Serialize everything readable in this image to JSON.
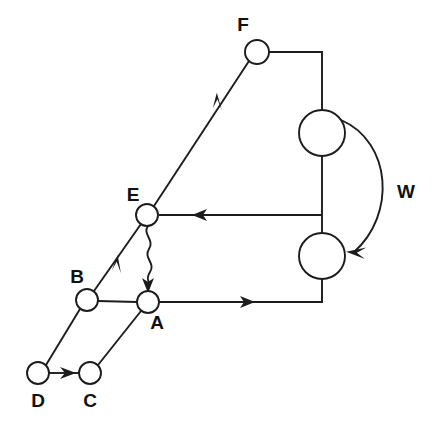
{
  "diagram": {
    "background_color": "#ffffff",
    "stroke_color": "#1c1c1c",
    "label_color": "#111111",
    "nodes": [
      {
        "id": "F",
        "label": "F",
        "cx": 257,
        "cy": 52,
        "r": 12,
        "label_x": 243,
        "label_y": 26,
        "size": "small"
      },
      {
        "id": "E",
        "label": "E",
        "cx": 147,
        "cy": 215,
        "r": 11,
        "label_x": 133,
        "label_y": 196,
        "size": "small"
      },
      {
        "id": "B",
        "label": "B",
        "cx": 87,
        "cy": 300,
        "r": 11,
        "label_x": 77,
        "label_y": 278,
        "size": "small"
      },
      {
        "id": "A",
        "label": "A",
        "cx": 148,
        "cy": 302,
        "r": 11,
        "label_x": 157,
        "label_y": 324,
        "size": "small"
      },
      {
        "id": "C",
        "label": "C",
        "cx": 90,
        "cy": 373,
        "r": 11,
        "label_x": 90,
        "label_y": 402,
        "size": "small"
      },
      {
        "id": "D",
        "label": "D",
        "cx": 38,
        "cy": 373,
        "r": 11,
        "label_x": 38,
        "label_y": 402,
        "size": "small"
      },
      {
        "id": "U1",
        "label": "",
        "cx": 322,
        "cy": 133,
        "r": 23,
        "label_x": null,
        "label_y": null,
        "size": "large"
      },
      {
        "id": "U2",
        "label": "",
        "cx": 322,
        "cy": 256,
        "r": 23,
        "label_x": null,
        "label_y": null,
        "size": "large"
      }
    ],
    "edges": [
      {
        "id": "E-to-F",
        "from": "E",
        "to": "F",
        "style": "straight",
        "arrow": "mid",
        "label": ""
      },
      {
        "id": "F-to-U1",
        "from": "F",
        "to": "U1",
        "style": "orthogonal",
        "arrow": "none",
        "label": ""
      },
      {
        "id": "U1-to-U2",
        "from": "U1",
        "to": "U2",
        "style": "straight",
        "arrow": "none",
        "label": ""
      },
      {
        "id": "U-to-E",
        "from": "U1U2-junction",
        "to": "E",
        "style": "straight",
        "arrow": "mid",
        "label": ""
      },
      {
        "id": "A-to-U2",
        "from": "A",
        "to": "U2",
        "style": "orthogonal",
        "arrow": "mid",
        "label": ""
      },
      {
        "id": "E-to-B",
        "from": "E",
        "to": "B",
        "style": "straight",
        "arrow": "mid",
        "label": ""
      },
      {
        "id": "E-to-A",
        "from": "E",
        "to": "A",
        "style": "wavy",
        "arrow": "end",
        "label": ""
      },
      {
        "id": "B-to-A",
        "from": "B",
        "to": "A",
        "style": "straight",
        "arrow": "none",
        "label": ""
      },
      {
        "id": "D-to-B",
        "from": "D",
        "to": "B",
        "style": "straight",
        "arrow": "none",
        "label": ""
      },
      {
        "id": "C-to-A",
        "from": "C",
        "to": "A",
        "style": "straight",
        "arrow": "none",
        "label": ""
      },
      {
        "id": "D-to-C",
        "from": "D",
        "to": "C",
        "style": "straight",
        "arrow": "mid",
        "label": ""
      },
      {
        "id": "U1-to-U2-arc",
        "from": "U1",
        "to": "U2",
        "style": "arc",
        "arrow": "end",
        "label": "W",
        "label_x": 406,
        "label_y": 193
      }
    ],
    "edge_labels": [
      {
        "text": "W",
        "x": 406,
        "y": 193
      }
    ]
  }
}
